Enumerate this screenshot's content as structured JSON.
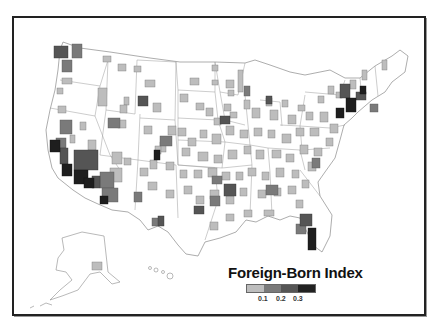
{
  "map": {
    "subject": "United States metropolitan areas",
    "regions_shown": [
      "Contiguous United States",
      "Alaska",
      "Hawaii"
    ]
  },
  "legend": {
    "title": "Foreign-Born Index",
    "bins": [
      {
        "color": "#bdbdbd",
        "label": ""
      },
      {
        "color": "#7a7a7a",
        "label": "0.1"
      },
      {
        "color": "#555555",
        "label": "0.2"
      },
      {
        "color": "#222222",
        "label": "0.3"
      }
    ],
    "tick_labels": [
      "0.1",
      "0.2",
      "0.3"
    ]
  },
  "colors": {
    "state_fill": "#ffffff",
    "state_border": "#9a9a9a",
    "frame": "#222222",
    "low": "#bdbdbd",
    "mid_low": "#7a7a7a",
    "mid_high": "#555555",
    "high": "#222222"
  }
}
